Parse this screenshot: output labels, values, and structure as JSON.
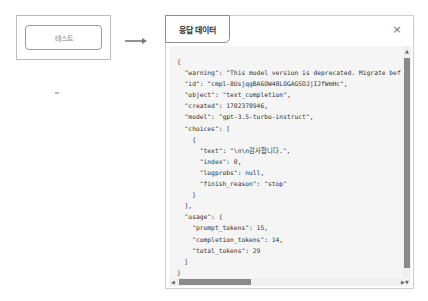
{
  "trigger": {
    "button_label": "테스트"
  },
  "modal": {
    "tab_title": "응답 데이터",
    "close_icon": "×",
    "code_lines": [
      "{",
      "  \"warning\": \"This model version is deprecated. Migrate bef",
      "  \"id\": \"cmpl-8UsjqgBA6OW48LOGAGSOJjIJfWmHc\",",
      "  \"object\": \"text_completion\",",
      "  \"created\": 1702370946,",
      "  \"model\": \"gpt-3.5-turbo-instruct\",",
      "  \"choices\": [",
      "    {",
      "      \"text\": \"\\n\\n감사합니다.\",",
      "      \"index\": 0,",
      "      \"logprobs\": null,",
      "      \"finish_reason\": \"stop\"",
      "    }",
      "  ],",
      "  \"usage\": {",
      "    \"prompt_tokens\": 15,",
      "    \"completion_tokens\": 14,",
      "    \"total_tokens\": 29",
      "  }",
      "}"
    ],
    "scroll": {
      "up_arrow": "▲",
      "down_arrow": "▼",
      "left_arrow": "◀",
      "right_arrow": "▶"
    }
  }
}
